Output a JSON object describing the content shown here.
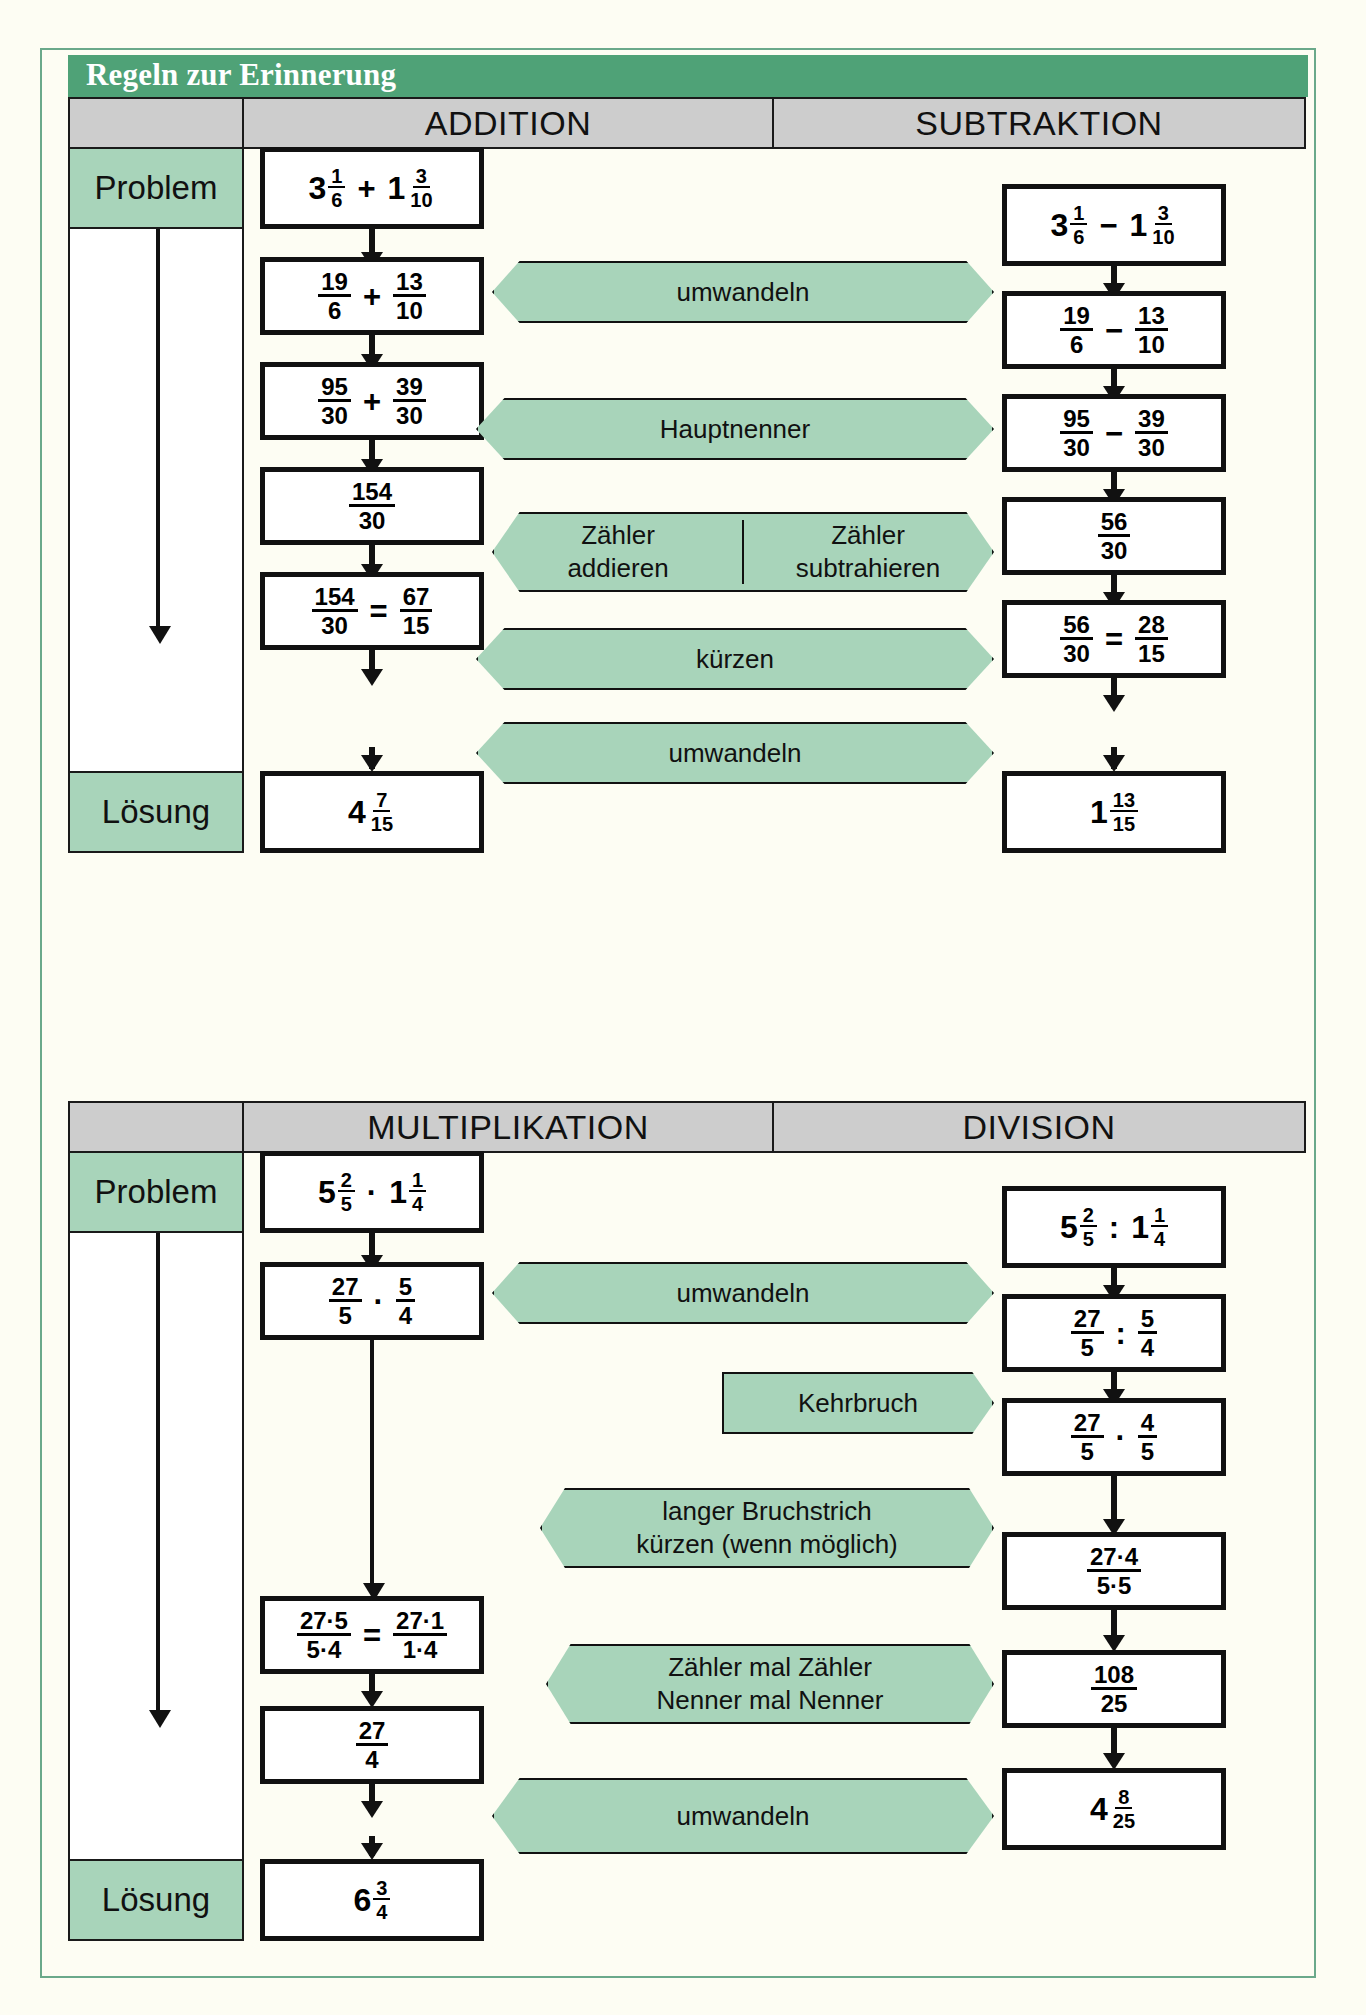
{
  "title": "Regeln zur Erinnerung",
  "colors": {
    "title_bar": "#4fa277",
    "header_cell": "#cdcdcd",
    "callout": "#a8d4ba",
    "box_border": "#111111",
    "page_bg": "#fdfdf3"
  },
  "labels": {
    "problem": "Problem",
    "loesung": "Lösung"
  },
  "section_one": {
    "headers": [
      "ADDITION",
      "SUBTRAKTION"
    ],
    "addition": {
      "steps": [
        {
          "kind": "mixed-op-mixed",
          "a_whole": "3",
          "a_num": "1",
          "a_den": "6",
          "op": "+",
          "b_whole": "1",
          "b_num": "3",
          "b_den": "10"
        },
        {
          "kind": "frac-op-frac",
          "a_num": "19",
          "a_den": "6",
          "op": "+",
          "b_num": "13",
          "b_den": "10"
        },
        {
          "kind": "frac-op-frac",
          "a_num": "95",
          "a_den": "30",
          "op": "+",
          "b_num": "39",
          "b_den": "30"
        },
        {
          "kind": "frac",
          "num": "154",
          "den": "30"
        },
        {
          "kind": "frac-eq-frac",
          "a_num": "154",
          "a_den": "30",
          "op": "=",
          "b_num": "67",
          "b_den": "15"
        },
        {
          "kind": "mixed",
          "whole": "4",
          "num": "7",
          "den": "15"
        }
      ]
    },
    "subtraktion": {
      "steps": [
        {
          "kind": "mixed-op-mixed",
          "a_whole": "3",
          "a_num": "1",
          "a_den": "6",
          "op": "−",
          "b_whole": "1",
          "b_num": "3",
          "b_den": "10"
        },
        {
          "kind": "frac-op-frac",
          "a_num": "19",
          "a_den": "6",
          "op": "−",
          "b_num": "13",
          "b_den": "10"
        },
        {
          "kind": "frac-op-frac",
          "a_num": "95",
          "a_den": "30",
          "op": "−",
          "b_num": "39",
          "b_den": "30"
        },
        {
          "kind": "frac",
          "num": "56",
          "den": "30"
        },
        {
          "kind": "frac-eq-frac",
          "a_num": "56",
          "a_den": "30",
          "op": "=",
          "b_num": "28",
          "b_den": "15"
        },
        {
          "kind": "mixed",
          "whole": "1",
          "num": "13",
          "den": "15"
        }
      ]
    },
    "callouts": [
      {
        "type": "both",
        "text": "umwandeln"
      },
      {
        "type": "both",
        "text": "Hauptnenner"
      },
      {
        "type": "both",
        "split": true,
        "left_line1": "Zähler",
        "left_line2": "addieren",
        "right_line1": "Zähler",
        "right_line2": "subtrahieren"
      },
      {
        "type": "both",
        "text": "kürzen"
      },
      {
        "type": "both",
        "text": "umwandeln"
      }
    ]
  },
  "section_two": {
    "headers": [
      "MULTIPLIKATION",
      "DIVISION"
    ],
    "multiplikation": {
      "steps": [
        {
          "kind": "mixed-op-mixed",
          "a_whole": "5",
          "a_num": "2",
          "a_den": "5",
          "op": "·",
          "b_whole": "1",
          "b_num": "1",
          "b_den": "4"
        },
        {
          "kind": "frac-op-frac",
          "a_num": "27",
          "a_den": "5",
          "op": "·",
          "b_num": "5",
          "b_den": "4"
        },
        {
          "kind": "frac-eq-frac",
          "a_num": "27·5",
          "a_den": "5·4",
          "op": "=",
          "b_num": "27·1",
          "b_den": "1·4"
        },
        {
          "kind": "frac",
          "num": "27",
          "den": "4"
        },
        {
          "kind": "mixed",
          "whole": "6",
          "num": "3",
          "den": "4"
        }
      ]
    },
    "division": {
      "steps": [
        {
          "kind": "mixed-op-mixed",
          "a_whole": "5",
          "a_num": "2",
          "a_den": "5",
          "op": ":",
          "b_whole": "1",
          "b_num": "1",
          "b_den": "4"
        },
        {
          "kind": "frac-op-frac",
          "a_num": "27",
          "a_den": "5",
          "op": ":",
          "b_num": "5",
          "b_den": "4"
        },
        {
          "kind": "frac-op-frac",
          "a_num": "27",
          "a_den": "5",
          "op": "·",
          "b_num": "4",
          "b_den": "5"
        },
        {
          "kind": "frac",
          "num": "27·4",
          "den": "5·5"
        },
        {
          "kind": "frac",
          "num": "108",
          "den": "25"
        },
        {
          "kind": "mixed",
          "whole": "4",
          "num": "8",
          "den": "25"
        }
      ]
    },
    "callouts": [
      {
        "type": "both",
        "text": "umwandeln"
      },
      {
        "type": "right",
        "text": "Kehrbruch"
      },
      {
        "type": "both",
        "line1": "langer Bruchstrich",
        "line2": "kürzen (wenn möglich)"
      },
      {
        "type": "both",
        "line1": "Zähler mal Zähler",
        "line2": "Nenner mal Nenner"
      },
      {
        "type": "both",
        "text": "umwandeln"
      }
    ]
  }
}
